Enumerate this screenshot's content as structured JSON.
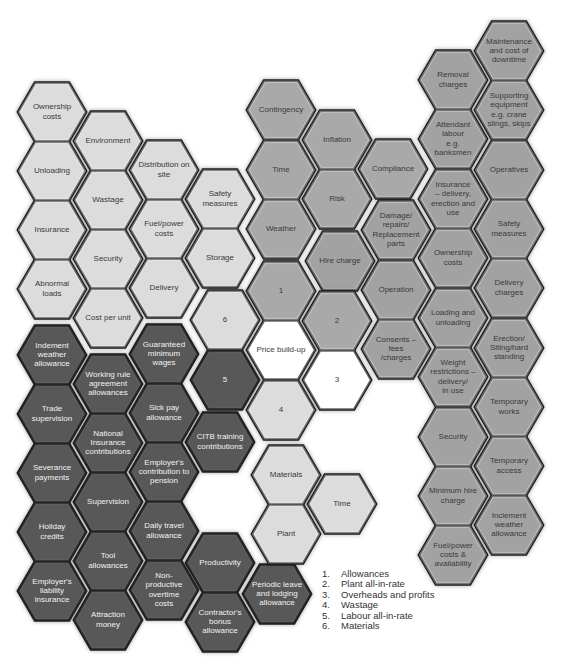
{
  "colors": {
    "light": "#dcdcdc",
    "medium": "#a9a9a9",
    "equipment": "#a2a2a2",
    "dark": "#585858",
    "center": "#ffffff",
    "outline": "#1e1e1e",
    "inner_line": "#6a6a6a",
    "text_dark": "#3a3a3a",
    "text_light": "#f2f2f2"
  },
  "clusters": [
    {
      "name": "materials-cluster",
      "tone": "light",
      "hexes": [
        {
          "label": [
            "Ownership",
            "costs"
          ],
          "cx": 52,
          "cy": 112
        },
        {
          "label": [
            "Environment"
          ],
          "cx": 108,
          "cy": 141
        },
        {
          "label": [
            "Distribution on",
            "site"
          ],
          "cx": 164,
          "cy": 170
        },
        {
          "label": [
            "Safety",
            "measures"
          ],
          "cx": 220,
          "cy": 199
        },
        {
          "label": [
            "Unloading"
          ],
          "cx": 52,
          "cy": 171
        },
        {
          "label": [
            "Wastage"
          ],
          "cx": 108,
          "cy": 200
        },
        {
          "label": [
            "Fuel/power",
            "costs"
          ],
          "cx": 164,
          "cy": 229
        },
        {
          "label": [
            "Storage"
          ],
          "cx": 220,
          "cy": 258
        },
        {
          "label": [
            "Insurance"
          ],
          "cx": 52,
          "cy": 230
        },
        {
          "label": [
            "Security"
          ],
          "cx": 108,
          "cy": 259
        },
        {
          "label": [
            "Delivery"
          ],
          "cx": 164,
          "cy": 288
        },
        {
          "label": [
            "Abnormal",
            "loads"
          ],
          "cx": 52,
          "cy": 289
        },
        {
          "label": [
            "Cost per unit"
          ],
          "cx": 108,
          "cy": 318
        }
      ]
    },
    {
      "name": "overheads-cluster",
      "tone": "medium",
      "hexes": [
        {
          "label": [
            "Contingency"
          ],
          "cx": 281,
          "cy": 110
        },
        {
          "label": [
            "Inflation"
          ],
          "cx": 337,
          "cy": 140
        },
        {
          "label": [
            "Compliance"
          ],
          "cx": 393,
          "cy": 169
        },
        {
          "label": [
            "Time"
          ],
          "cx": 281,
          "cy": 170
        },
        {
          "label": [
            "Risk"
          ],
          "cx": 337,
          "cy": 199
        },
        {
          "label": [
            "Weather"
          ],
          "cx": 281,
          "cy": 229
        }
      ]
    },
    {
      "name": "plant-cluster",
      "tone": "equipment",
      "hexes": [
        {
          "label": [
            "Maintenance",
            "and cost of",
            "downtime"
          ],
          "cx": 509,
          "cy": 51
        },
        {
          "label": [
            "Removal",
            "charges"
          ],
          "cx": 453,
          "cy": 80
        },
        {
          "label": [
            "Supporting",
            "equipment",
            "e.g. crane",
            "slings, skips"
          ],
          "cx": 509,
          "cy": 110
        },
        {
          "label": [
            "Attendant",
            "labour",
            "e.g.",
            "banksmen"
          ],
          "cx": 453,
          "cy": 139
        },
        {
          "label": [
            "Operatives"
          ],
          "cx": 509,
          "cy": 170
        },
        {
          "label": [
            "Insurance",
            "– delivery,",
            "erection and",
            "use"
          ],
          "cx": 453,
          "cy": 199
        },
        {
          "label": [
            "Safety",
            "measures"
          ],
          "cx": 509,
          "cy": 229
        },
        {
          "label": [
            "Damage/",
            "repairs/",
            "Replacement",
            "parts"
          ],
          "cx": 396,
          "cy": 230
        },
        {
          "label": [
            "Hire charge"
          ],
          "cx": 340,
          "cy": 261
        },
        {
          "label": [
            "Ownership",
            "costs"
          ],
          "cx": 453,
          "cy": 258
        },
        {
          "label": [
            "Delivery",
            "charges"
          ],
          "cx": 509,
          "cy": 288
        },
        {
          "label": [
            "Operation"
          ],
          "cx": 396,
          "cy": 290
        },
        {
          "label": [
            "Loading and",
            "unloading"
          ],
          "cx": 453,
          "cy": 318
        },
        {
          "label": [
            "Consents –",
            "fees",
            "/charges"
          ],
          "cx": 396,
          "cy": 349
        },
        {
          "label": [
            "Erection/",
            "Siting/hard",
            "standing"
          ],
          "cx": 509,
          "cy": 348
        },
        {
          "label": [
            "Weight",
            "restrictions –",
            "delivery/",
            "in use"
          ],
          "cx": 453,
          "cy": 377
        },
        {
          "label": [
            "Temporary",
            "works"
          ],
          "cx": 509,
          "cy": 407
        },
        {
          "label": [
            "Security"
          ],
          "cx": 453,
          "cy": 437
        },
        {
          "label": [
            "Temporary",
            "access"
          ],
          "cx": 509,
          "cy": 466
        },
        {
          "label": [
            "Minimum hire",
            "charge"
          ],
          "cx": 453,
          "cy": 496
        },
        {
          "label": [
            "Inclement",
            "weather",
            "allowance"
          ],
          "cx": 509,
          "cy": 525
        },
        {
          "label": [
            "Fuel/power",
            "costs &",
            "availability"
          ],
          "cx": 453,
          "cy": 555
        }
      ]
    },
    {
      "name": "labour-cluster",
      "tone": "dark",
      "hexes": [
        {
          "label": [
            "Indement",
            "weather",
            "allowance"
          ],
          "cx": 52,
          "cy": 355
        },
        {
          "label": [
            "Working rule",
            "agreement",
            "allowances"
          ],
          "cx": 108,
          "cy": 384
        },
        {
          "label": [
            "Guaranteed",
            "minimum",
            "wages"
          ],
          "cx": 164,
          "cy": 354
        },
        {
          "label": [
            "Trade",
            "supervision"
          ],
          "cx": 52,
          "cy": 414
        },
        {
          "label": [
            "National",
            "Insurance",
            "contributions"
          ],
          "cx": 108,
          "cy": 443
        },
        {
          "label": [
            "Sick pay",
            "allowance"
          ],
          "cx": 164,
          "cy": 413
        },
        {
          "label": [
            "CITB training",
            "contributions"
          ],
          "cx": 220,
          "cy": 442
        },
        {
          "label": [
            "Severance",
            "payments"
          ],
          "cx": 52,
          "cy": 473
        },
        {
          "label": [
            "Employer's",
            "contribution to",
            "pension"
          ],
          "cx": 164,
          "cy": 472
        },
        {
          "label": [
            "Supervision"
          ],
          "cx": 108,
          "cy": 502
        },
        {
          "label": [
            "Holiday",
            "credits"
          ],
          "cx": 52,
          "cy": 532
        },
        {
          "label": [
            "Daily travel",
            "allowance"
          ],
          "cx": 164,
          "cy": 531
        },
        {
          "label": [
            "Tool",
            "allowances"
          ],
          "cx": 108,
          "cy": 561
        },
        {
          "label": [
            "Productivity"
          ],
          "cx": 220,
          "cy": 563
        },
        {
          "label": [
            "Employer's",
            "liability",
            "insurance"
          ],
          "cx": 52,
          "cy": 591
        },
        {
          "label": [
            "Non-",
            "productive",
            "overtime",
            "costs"
          ],
          "cx": 164,
          "cy": 590
        },
        {
          "label": [
            "Periodic leave",
            "and lodging",
            "allowance"
          ],
          "cx": 277,
          "cy": 594
        },
        {
          "label": [
            "Attraction",
            "money"
          ],
          "cx": 108,
          "cy": 620
        },
        {
          "label": [
            "Contractor's",
            "bonus",
            "allowance"
          ],
          "cx": 220,
          "cy": 622
        }
      ]
    },
    {
      "name": "price-build-up-cluster",
      "tone": "mixed",
      "hexes": [
        {
          "label": [
            "1"
          ],
          "cx": 281,
          "cy": 291,
          "tone": "medium"
        },
        {
          "label": [
            "6"
          ],
          "cx": 225,
          "cy": 320,
          "tone": "light"
        },
        {
          "label": [
            "2"
          ],
          "cx": 337,
          "cy": 321,
          "tone": "medium"
        },
        {
          "label": [
            "Price build-up"
          ],
          "cx": 281,
          "cy": 350,
          "tone": "center"
        },
        {
          "label": [
            "5"
          ],
          "cx": 225,
          "cy": 380,
          "tone": "dark"
        },
        {
          "label": [
            "3"
          ],
          "cx": 337,
          "cy": 380,
          "tone": "center"
        },
        {
          "label": [
            "4"
          ],
          "cx": 281,
          "cy": 410,
          "tone": "light"
        }
      ]
    },
    {
      "name": "resources-cluster",
      "tone": "light",
      "hexes": [
        {
          "label": [
            "Materials"
          ],
          "cx": 286,
          "cy": 475
        },
        {
          "label": [
            "Time"
          ],
          "cx": 342,
          "cy": 504
        },
        {
          "label": [
            "Plant"
          ],
          "cx": 286,
          "cy": 534
        }
      ]
    }
  ],
  "legend": [
    {
      "num": "1.",
      "text": "Allowances"
    },
    {
      "num": "2.",
      "text": "Plant all-in-rate"
    },
    {
      "num": "3.",
      "text": "Overheads and profits"
    },
    {
      "num": "4.",
      "text": "Wastage"
    },
    {
      "num": "5.",
      "text": "Labour all-in-rate"
    },
    {
      "num": "6.",
      "text": "Materials"
    }
  ]
}
